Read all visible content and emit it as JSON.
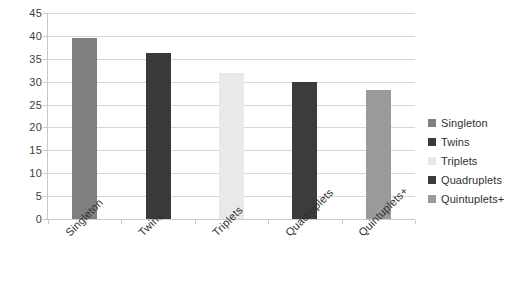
{
  "chart_data": {
    "type": "bar",
    "title": "",
    "subtitle": "",
    "xlabel": "",
    "ylabel": "",
    "categories": [
      "Singleton",
      "Twins",
      "Triplets",
      "Quadruplets",
      "Quintuplets+"
    ],
    "values": [
      39.6,
      36.2,
      32.0,
      30.0,
      28.2
    ],
    "series": [
      {
        "name": "Birth Type",
        "values": [
          39.6,
          36.2,
          32.0,
          30.0,
          28.2
        ]
      }
    ],
    "ylim": [
      0,
      45
    ],
    "ytick_labels": [
      "45",
      "40",
      "35",
      "30",
      "25",
      "20",
      "15",
      "10",
      "5",
      "0"
    ],
    "ytick_values": [
      45,
      40,
      35,
      30,
      25,
      20,
      15,
      10,
      5,
      0
    ],
    "ytick_step": 5,
    "grid": true,
    "grid_axis": "y",
    "legend_position": "right",
    "legend": [
      {
        "label": "Singleton",
        "color": "#7f7f7f"
      },
      {
        "label": "Twins",
        "color": "#3a3a3a"
      },
      {
        "label": "Triplets",
        "color": "#e9e9e9"
      },
      {
        "label": "Quadruplets",
        "color": "#3c3c3c"
      },
      {
        "label": "Quintuplets+",
        "color": "#9a9a9a"
      }
    ],
    "bar_colors": [
      "#7f7f7f",
      "#3a3a3a",
      "#e9e9e9",
      "#3c3c3c",
      "#9a9a9a"
    ],
    "xtick_rotation": -45,
    "background_color": "#ffffff",
    "gridline_color": "#d7d7d7",
    "axis_color": "#c9c9c9",
    "text_color": "#2f2f2f"
  }
}
